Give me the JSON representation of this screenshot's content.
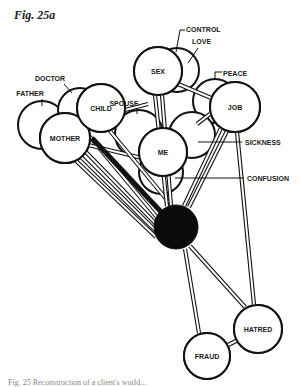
{
  "figure": {
    "title": "Fig. 25a",
    "caption": "Fig. 25 Reconstruction of a client's world..."
  },
  "diagram": {
    "stroke": "#111111",
    "fill": "#ffffff",
    "center_fill": "#0a0a0a",
    "nodes": [
      {
        "id": "father",
        "label": "FATHER",
        "cx": 42,
        "cy": 125,
        "r": 24,
        "labelPos": "outside",
        "lx": 30,
        "ly": 96,
        "tick": [
          42,
          99,
          42,
          106
        ]
      },
      {
        "id": "doctor",
        "label": "DOCTOR",
        "cx": 80,
        "cy": 110,
        "r": 22,
        "labelPos": "outside",
        "lx": 50,
        "ly": 81,
        "tick": [
          64,
          84,
          72,
          93
        ]
      },
      {
        "id": "mother",
        "label": "MOTHER",
        "cx": 65,
        "cy": 138,
        "r": 25,
        "labelPos": "inside"
      },
      {
        "id": "child",
        "label": "CHILD",
        "cx": 101,
        "cy": 108,
        "r": 24,
        "labelPos": "inside"
      },
      {
        "id": "love",
        "label": "LOVE",
        "cx": 177,
        "cy": 70,
        "r": 22,
        "labelPos": "outside",
        "lx": 192,
        "ly": 44,
        "tick": [
          198,
          48,
          188,
          63
        ]
      },
      {
        "id": "control",
        "label": "CONTROL",
        "cx": 177,
        "cy": 70,
        "r": 0,
        "labelPos": "outside",
        "lx": 186,
        "ly": 32,
        "tick": [
          180,
          30,
          176,
          52
        ]
      },
      {
        "id": "sex",
        "label": "SEX",
        "cx": 158,
        "cy": 71,
        "r": 24,
        "labelPos": "inside"
      },
      {
        "id": "spouse",
        "label": "SPOUSE",
        "cx": 139,
        "cy": 134,
        "r": 24,
        "labelPos": "outside",
        "lx": 124,
        "ly": 106,
        "tick": [
          137,
          108,
          137,
          114
        ]
      },
      {
        "id": "peace",
        "label": "PEACE",
        "cx": 215,
        "cy": 101,
        "r": 22,
        "labelPos": "outside",
        "lx": 223,
        "ly": 76,
        "tick": [
          215,
          72,
          215,
          78
        ]
      },
      {
        "id": "sickness",
        "label": "SICKNESS",
        "cx": 192,
        "cy": 135,
        "r": 23,
        "labelPos": "outside",
        "lx": 245,
        "ly": 145,
        "tick": [
          198,
          142,
          242,
          142
        ]
      },
      {
        "id": "job",
        "label": "JOB",
        "cx": 235,
        "cy": 107,
        "r": 25,
        "labelPos": "inside"
      },
      {
        "id": "confusion",
        "label": "CONFUSION",
        "cx": 161,
        "cy": 172,
        "r": 22,
        "labelPos": "outside",
        "lx": 247,
        "ly": 181,
        "tick": [
          175,
          178,
          244,
          178
        ]
      },
      {
        "id": "me",
        "label": "ME",
        "cx": 163,
        "cy": 152,
        "r": 24,
        "labelPos": "inside"
      },
      {
        "id": "hatred",
        "label": "HATRED",
        "cx": 258,
        "cy": 329,
        "r": 24,
        "labelPos": "inside"
      },
      {
        "id": "fraud",
        "label": "FRAUD",
        "cx": 207,
        "cy": 356,
        "r": 23,
        "labelPos": "inside"
      }
    ],
    "center": {
      "id": "center",
      "cx": 176,
      "cy": 227,
      "r": 22
    },
    "links": [
      {
        "from": [
          85,
          131
        ],
        "to": [
          160,
          221
        ],
        "type": "double"
      },
      {
        "from": [
          80,
          146
        ],
        "to": [
          159,
          227
        ],
        "type": "double"
      },
      {
        "from": [
          76,
          152
        ],
        "to": [
          157,
          232
        ],
        "type": "double"
      },
      {
        "from": [
          72,
          157
        ],
        "to": [
          156,
          237
        ],
        "type": "double"
      },
      {
        "from": [
          84,
          144
        ],
        "to": [
          150,
          160
        ],
        "type": "double"
      },
      {
        "from": [
          92,
          138
        ],
        "to": [
          163,
          214
        ],
        "type": "solid"
      },
      {
        "from": [
          110,
          131
        ],
        "to": [
          172,
          206
        ],
        "type": "double"
      },
      {
        "from": [
          125,
          110
        ],
        "to": [
          148,
          104
        ],
        "type": "double"
      },
      {
        "from": [
          155,
          95
        ],
        "to": [
          167,
          206
        ],
        "type": "double"
      },
      {
        "from": [
          162,
          95
        ],
        "to": [
          171,
          206
        ],
        "type": "double"
      },
      {
        "from": [
          178,
          84
        ],
        "to": [
          216,
          100
        ],
        "type": "double"
      },
      {
        "from": [
          197,
          124
        ],
        "to": [
          210,
          114
        ],
        "type": "double"
      },
      {
        "from": [
          221,
          128
        ],
        "to": [
          184,
          206
        ],
        "type": "double"
      },
      {
        "from": [
          227,
          131
        ],
        "to": [
          189,
          207
        ],
        "type": "double"
      },
      {
        "from": [
          237,
          132
        ],
        "to": [
          254,
          305
        ],
        "type": "double"
      },
      {
        "from": [
          185,
          249
        ],
        "to": [
          199,
          333
        ],
        "type": "double"
      },
      {
        "from": [
          190,
          246
        ],
        "to": [
          245,
          307
        ],
        "type": "double"
      },
      {
        "from": [
          222,
          348
        ],
        "to": [
          238,
          340
        ],
        "type": "double"
      }
    ]
  }
}
